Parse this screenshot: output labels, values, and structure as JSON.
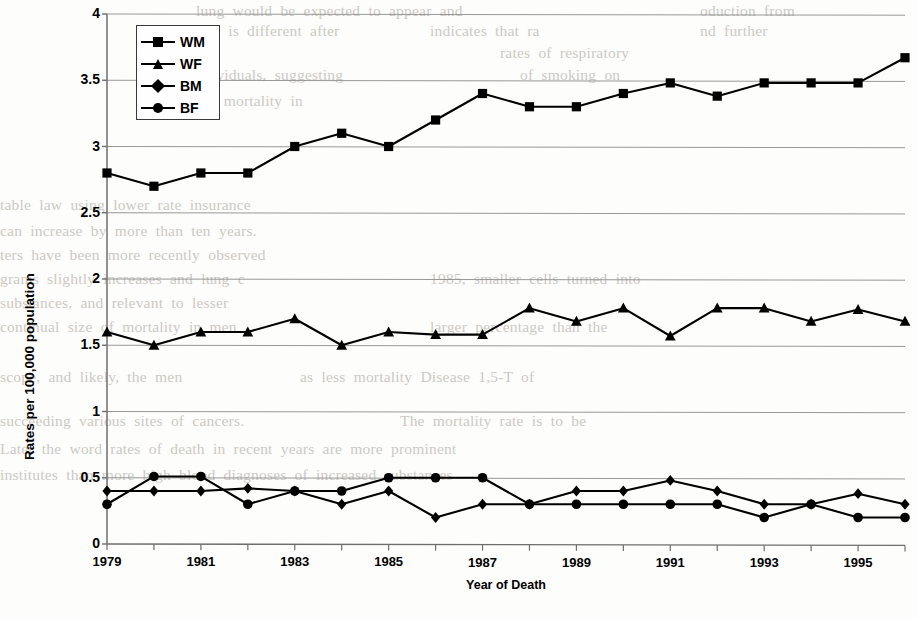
{
  "chart_data": {
    "type": "line",
    "title": "",
    "xlabel": "Year of Death",
    "ylabel": "Rates per 100,000 population",
    "xlim": [
      1979,
      1996
    ],
    "ylim": [
      0,
      4
    ],
    "ytick_step": 0.5,
    "yticks": [
      "0",
      "0.5",
      "1",
      "1.5",
      "2",
      "2.5",
      "3",
      "3.5",
      "4"
    ],
    "ytick_values": [
      0,
      0.5,
      1,
      1.5,
      2,
      2.5,
      3,
      3.5,
      4
    ],
    "x": [
      1979,
      1980,
      1981,
      1982,
      1983,
      1984,
      1985,
      1986,
      1987,
      1988,
      1989,
      1990,
      1991,
      1992,
      1993,
      1994,
      1995,
      1996
    ],
    "xticks_labeled": [
      "1979",
      "1981",
      "1983",
      "1985",
      "1987",
      "1989",
      "1991",
      "1993",
      "1995"
    ],
    "xtick_label_values": [
      1979,
      1981,
      1983,
      1985,
      1987,
      1989,
      1991,
      1993,
      1995
    ],
    "grid": "horizontal",
    "legend_position": "top-left-inside",
    "series": [
      {
        "name": "WM",
        "marker": "square",
        "values": [
          2.8,
          2.7,
          2.8,
          2.8,
          3.0,
          3.1,
          3.0,
          3.2,
          3.4,
          3.3,
          3.3,
          3.4,
          3.48,
          3.38,
          3.48,
          3.48,
          3.48,
          3.67
        ]
      },
      {
        "name": "WF",
        "marker": "triangle",
        "values": [
          1.6,
          1.5,
          1.6,
          1.6,
          1.7,
          1.5,
          1.6,
          1.58,
          1.58,
          1.78,
          1.68,
          1.78,
          1.57,
          1.78,
          1.78,
          1.68,
          1.77,
          1.68
        ]
      },
      {
        "name": "BM",
        "marker": "diamond",
        "values": [
          0.4,
          0.4,
          0.4,
          0.42,
          0.4,
          0.3,
          0.4,
          0.2,
          0.3,
          0.3,
          0.4,
          0.4,
          0.48,
          0.4,
          0.3,
          0.3,
          0.38,
          0.3
        ]
      },
      {
        "name": "BF",
        "marker": "circle",
        "values": [
          0.3,
          0.51,
          0.51,
          0.3,
          0.4,
          0.4,
          0.5,
          0.5,
          0.5,
          0.3,
          0.3,
          0.3,
          0.3,
          0.3,
          0.2,
          0.3,
          0.2,
          0.2
        ]
      }
    ]
  },
  "legend": {
    "items": [
      {
        "label": "WM",
        "marker": "square"
      },
      {
        "label": "WF",
        "marker": "triangle"
      },
      {
        "label": "BM",
        "marker": "diamond"
      },
      {
        "label": "BF",
        "marker": "circle"
      }
    ]
  },
  "style": {
    "line_color": "#000000",
    "grid_color": "#8c8c8c",
    "axis_color": "#6e6e6e",
    "background": "#fdfdfb",
    "bleed_text_color": "#b9b6b0"
  },
  "background_bleed": {
    "lines": [
      {
        "text": "lung  would  be  expected  to  appear  and",
        "x": 196,
        "y": 2
      },
      {
        "text": "oduction  from",
        "x": 700,
        "y": 2
      },
      {
        "text": "fact  is  different  after",
        "x": 196,
        "y": 22
      },
      {
        "text": "indicates  that  ra",
        "x": 430,
        "y": 22
      },
      {
        "text": "nd  further",
        "x": 700,
        "y": 22
      },
      {
        "text": "rates  of  respiratory",
        "x": 500,
        "y": 44
      },
      {
        "text": "ndividuals,  suggesting",
        "x": 196,
        "y": 66
      },
      {
        "text": "of  smoking  on",
        "x": 520,
        "y": 66
      },
      {
        "text": "cer  mortality  in",
        "x": 196,
        "y": 92
      },
      {
        "text": "table  law  using  lower  rate  insurance",
        "x": 0,
        "y": 196
      },
      {
        "text": "can  increase  by  more  than  ten  years.",
        "x": 0,
        "y": 222
      },
      {
        "text": "ters  have  been  more  recently  observed",
        "x": 0,
        "y": 246
      },
      {
        "text": "grams  slightly  increases  and  lung  c",
        "x": 0,
        "y": 270
      },
      {
        "text": "1985,  smaller  cells  turned  into",
        "x": 430,
        "y": 270
      },
      {
        "text": "substances,  and  relevant  to  lesser",
        "x": 0,
        "y": 294
      },
      {
        "text": "continual  size  of  mortality  in  men",
        "x": 0,
        "y": 318
      },
      {
        "text": "larger  percentage  than  the",
        "x": 430,
        "y": 318
      },
      {
        "text": "scope,  and  likely,  the  men",
        "x": 0,
        "y": 368
      },
      {
        "text": "as  less  mortality  Disease  1,5-T  of",
        "x": 300,
        "y": 368
      },
      {
        "text": "succeeding  various  sites  of  cancers.",
        "x": 0,
        "y": 412
      },
      {
        "text": "The  mortality  rate  is  to  be",
        "x": 400,
        "y": 412
      },
      {
        "text": "Later  the  word  rates  of  death  in  recent  years  are  more  prominent",
        "x": 0,
        "y": 440
      },
      {
        "text": "institutes  than  more  high  blood  diagnoses  of  increased  substances",
        "x": 0,
        "y": 466
      }
    ]
  }
}
